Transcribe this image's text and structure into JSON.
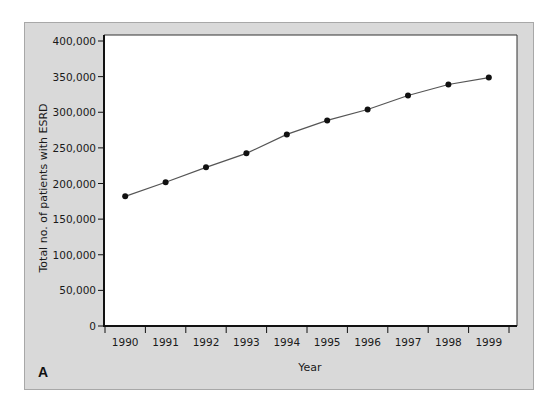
{
  "chart_data": {
    "type": "line",
    "title": "",
    "panel_label": "A",
    "xlabel": "Year",
    "ylabel": "Total no. of patients with ESRD",
    "categories": [
      "1990",
      "1991",
      "1992",
      "1993",
      "1994",
      "1995",
      "1996",
      "1997",
      "1998",
      "1999"
    ],
    "series": [
      {
        "name": "Total no. of patients with ESRD",
        "values": [
          182000,
          201700,
          222700,
          242300,
          268900,
          288500,
          303900,
          323500,
          338900,
          348700
        ]
      }
    ],
    "ylim": [
      0,
      400000
    ],
    "yticks": [
      0,
      50000,
      100000,
      150000,
      200000,
      250000,
      300000,
      350000,
      400000
    ],
    "ytick_labels": [
      "0",
      "50,000",
      "100,000",
      "150,000",
      "200,000",
      "250,000",
      "300,000",
      "350,000",
      "400,000"
    ],
    "grid": false,
    "legend": "none",
    "colors": {
      "panel_background": "#d9d9d9",
      "plot_background": "#ffffff",
      "line": "#555555",
      "marker": "#111111"
    }
  }
}
